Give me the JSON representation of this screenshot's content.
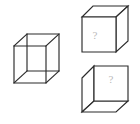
{
  "figure": {
    "title": "",
    "type": "cube-net-reasoning-puzzle",
    "background_color": "#ffffff",
    "stroke_color": "#2b2b2b",
    "question_mark_color": "#b9b9b9",
    "canvas": {
      "width": 140,
      "height": 124
    },
    "items": [
      {
        "id": "wireframe-cube",
        "name": "transparent-wireframe-cube",
        "label": "",
        "style": "wireframe",
        "description": "Transparent cube drawn with all twelve edges visible, viewed from upper-right",
        "position": {
          "x": 13,
          "y": 33
        },
        "size": {
          "width": 48,
          "height": 52
        },
        "vertices": {
          "front_top_left": [
            14,
            46
          ],
          "front_top_right": [
            46,
            46
          ],
          "front_bottom_right": [
            46,
            83
          ],
          "front_bottom_left": [
            14,
            83
          ],
          "back_top_left": [
            27,
            34
          ],
          "back_top_right": [
            59,
            34
          ],
          "back_bottom_right": [
            59,
            71
          ],
          "back_bottom_left": [
            27,
            71
          ]
        },
        "faces_visible": [
          "front",
          "top",
          "right",
          "back",
          "left",
          "bottom"
        ],
        "question_mark": false
      },
      {
        "id": "opaque-cube-top",
        "name": "opaque-cube-top-right",
        "label": "?",
        "style": "opaque",
        "description": "Solid cube viewed from the right; question mark on the front-left square face",
        "position": {
          "x": 82,
          "y": 6
        },
        "size": {
          "width": 46,
          "height": 52
        },
        "vertices": {
          "front_top_left": [
            82,
            17
          ],
          "front_top_right": [
            116,
            17
          ],
          "front_bottom_right": [
            116,
            52
          ],
          "front_bottom_left": [
            82,
            52
          ],
          "back_top_left": [
            93,
            6
          ],
          "back_top_right": [
            128,
            6
          ],
          "back_bottom_right": [
            128,
            41
          ]
        },
        "faces_visible": [
          "front",
          "top",
          "right"
        ],
        "question_mark": true,
        "question_mark_face": "front",
        "question_mark_position": {
          "x": 95,
          "y": 36
        }
      },
      {
        "id": "opaque-cube-bottom",
        "name": "opaque-cube-bottom-right",
        "label": "?",
        "style": "opaque",
        "description": "Solid cube viewed from the left; question mark on the front-right square face",
        "position": {
          "x": 82,
          "y": 66
        },
        "size": {
          "width": 48,
          "height": 52
        },
        "vertices": {
          "front_top_left": [
            94,
            66
          ],
          "front_top_right": [
            128,
            66
          ],
          "front_bottom_right": [
            128,
            101
          ],
          "front_bottom_left": [
            94,
            101
          ],
          "left_top": [
            82,
            78
          ],
          "left_bottom": [
            82,
            112
          ],
          "bottom_front_right": [
            116,
            112
          ]
        },
        "faces_visible": [
          "front",
          "left",
          "bottom"
        ],
        "question_mark": true,
        "question_mark_face": "front",
        "question_mark_position": {
          "x": 111,
          "y": 80
        }
      }
    ]
  }
}
